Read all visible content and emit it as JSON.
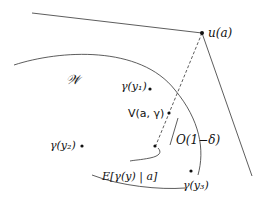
{
  "diagram": {
    "labels": {
      "u_a": "u(a)",
      "W": "𝒲",
      "gamma_y1": "γ(y₁)",
      "V": "V(a, γ)",
      "gamma_y2": "γ(y₂)",
      "O": "O(1−δ)",
      "E": "E[γ(y) | a]",
      "gamma_y3": "γ(y₃)"
    },
    "colors": {
      "ink": "#111111",
      "background": "#ffffff"
    }
  }
}
